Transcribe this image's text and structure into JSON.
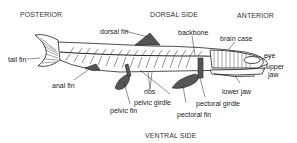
{
  "diagram": {
    "orientation": {
      "posterior": "POSTERIOR",
      "dorsal": "DORSAL SIDE",
      "anterior": "ANTERIOR",
      "ventral": "VENTRAL SIDE"
    },
    "labels": {
      "dorsal_fin": "dorsal fin",
      "backbone": "backbone",
      "brain_case": "brain case",
      "eye": "eye",
      "upper_jaw_1": "upper",
      "upper_jaw_2": "jaw",
      "lower_jaw": "lower jaw",
      "tail_fin": "tail fin",
      "anal_fin": "anal fin",
      "ribs": "ribs",
      "pelvic_girdle": "pelvic girdle",
      "pelvic_fin": "pelvic fin",
      "pectoral_girdle": "pectoral girdle",
      "pectoral_fin": "pectoral fin"
    },
    "colors": {
      "line": "#222222",
      "fill": "#555555"
    }
  }
}
